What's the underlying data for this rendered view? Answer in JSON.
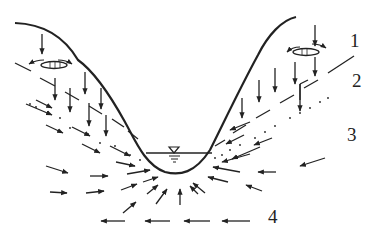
{
  "diagram": {
    "type": "hydrogeological cross-section",
    "colors": {
      "ink": "#222222",
      "background": "#ffffff"
    },
    "zone_labels": [
      {
        "id": "1",
        "text": "1",
        "x": 350,
        "y": 47
      },
      {
        "id": "2",
        "text": "2",
        "x": 352,
        "y": 84
      },
      {
        "id": "3",
        "text": "3",
        "x": 348,
        "y": 141
      },
      {
        "id": "4",
        "text": "4",
        "x": 270,
        "y": 222
      }
    ],
    "symbols": {
      "water_level": "water-table-triangle",
      "perched_lenses": 2
    }
  }
}
